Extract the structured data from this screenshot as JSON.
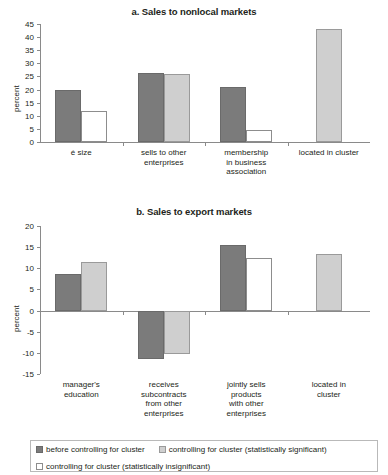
{
  "figure": {
    "ylabel": "percent",
    "legend": [
      {
        "key": "dark",
        "label": "before controlling for cluster"
      },
      {
        "key": "light",
        "label": "controlling for cluster (statistically significant)"
      },
      {
        "key": "open",
        "label": "controlling for cluster (statistically insignificant)"
      }
    ]
  },
  "chart_data": [
    {
      "type": "bar",
      "id": "a",
      "title": "a. Sales to nonlocal markets",
      "xlabel": "",
      "ylabel": "percent",
      "ylim": [
        0,
        45
      ],
      "yticks": [
        0,
        5,
        10,
        15,
        20,
        25,
        30,
        35,
        40,
        45
      ],
      "ytick_labels": [
        "0",
        "5",
        "10",
        "15",
        "20",
        "25",
        "30",
        "35",
        "40",
        "45"
      ],
      "grid": false,
      "legend_position": "below-figure",
      "categories": [
        "é size",
        "sells to other enterprises",
        "membership in business association",
        "located in cluster"
      ],
      "category_lines": [
        [
          "é size"
        ],
        [
          "sells to other",
          "enterprises"
        ],
        [
          "membership",
          "in business",
          "association"
        ],
        [
          "located in cluster"
        ]
      ],
      "series": [
        {
          "name": "before controlling for cluster",
          "style": "dark",
          "values": [
            19.8,
            26.2,
            20.8,
            null
          ]
        },
        {
          "name": "controlling for cluster (statistically significant)",
          "style": "light",
          "values": [
            null,
            25.9,
            null,
            43.2
          ]
        },
        {
          "name": "controlling for cluster (statistically insignificant)",
          "style": "open",
          "values": [
            12.0,
            null,
            4.4,
            null
          ]
        }
      ]
    },
    {
      "type": "bar",
      "id": "b",
      "title": "b. Sales to export markets",
      "xlabel": "",
      "ylabel": "percent",
      "ylim": [
        -15,
        20
      ],
      "yticks": [
        -15,
        -10,
        -5,
        0,
        5,
        10,
        15,
        20
      ],
      "ytick_labels": [
        "-15",
        "-10",
        "-5",
        "0",
        "5",
        "10",
        "15",
        "20"
      ],
      "grid": false,
      "legend_position": "below-figure",
      "categories": [
        "manager's education",
        "receives subcontracts from other enterprises",
        "jointly sells products with other enterprises",
        "located in cluster"
      ],
      "category_lines": [
        [
          "manager's",
          "education"
        ],
        [
          "receives",
          "subcontracts",
          "from other",
          "enterprises"
        ],
        [
          "jointly sells",
          "products",
          "with other",
          "enterprises"
        ],
        [
          "located in",
          "cluster"
        ]
      ],
      "series": [
        {
          "name": "before controlling for cluster",
          "style": "dark",
          "values": [
            8.7,
            -11.5,
            15.5,
            null
          ]
        },
        {
          "name": "controlling for cluster (statistically significant)",
          "style": "light",
          "values": [
            11.5,
            -10.3,
            null,
            13.3
          ]
        },
        {
          "name": "controlling for cluster (statistically insignificant)",
          "style": "open",
          "values": [
            null,
            null,
            12.4,
            null
          ]
        }
      ]
    }
  ]
}
